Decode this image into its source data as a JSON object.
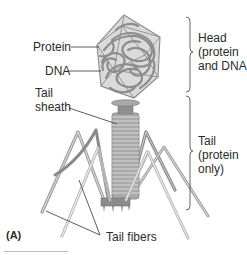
{
  "figure": {
    "panel_label": "(A)",
    "labels": {
      "protein": "Protein",
      "dna": "DNA",
      "tail_sheath_line1": "Tail",
      "tail_sheath_line2": "sheath",
      "tail_fibers": "Tail fibers"
    },
    "brackets": {
      "head": {
        "line1": "Head",
        "line2": "(protein",
        "line3": "and DNA)"
      },
      "tail": {
        "line1": "Tail",
        "line2": "(protein",
        "line3": "only)"
      }
    },
    "colors": {
      "capsid_fill": "#d9d9d9",
      "capsid_edge": "#8a8a8a",
      "dna": "#8c8c8c",
      "sheath": "#a6a6a6",
      "fiber_dark": "#8f8f8f",
      "fiber_light": "#c4c4c4",
      "text": "#2b2b2b",
      "leader": "#4a4a4a"
    }
  }
}
